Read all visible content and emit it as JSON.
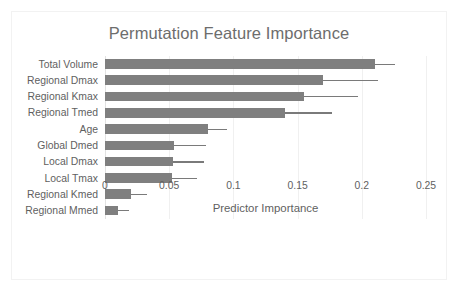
{
  "chart_data": {
    "type": "bar",
    "orientation": "horizontal",
    "title": "Permutation Feature Importance",
    "xlabel": "Predictor Importance",
    "ylabel": "",
    "xlim": [
      0,
      0.25
    ],
    "xticks": [
      "0",
      "0.05",
      "0.1",
      "0.15",
      "0.2",
      "0.25"
    ],
    "xtick_values": [
      0,
      0.05,
      0.1,
      0.15,
      0.2,
      0.25
    ],
    "grid": "vertical",
    "legend": "none",
    "bar_color": "#7f7f7f",
    "error_color": "#7a7a7a",
    "categories": [
      "Total Volume",
      "Regional Dmax",
      "Regional Kmax",
      "Regional Tmed",
      "Age",
      "Global Dmed",
      "Local Dmax",
      "Local Tmax",
      "Regional Kmed",
      "Regional Mmed"
    ],
    "values": [
      0.21,
      0.17,
      0.155,
      0.14,
      0.08,
      0.054,
      0.053,
      0.052,
      0.02,
      0.01
    ],
    "error_upper": [
      0.226,
      0.213,
      0.197,
      0.177,
      0.095,
      0.079,
      0.077,
      0.072,
      0.033,
      0.019
    ]
  }
}
